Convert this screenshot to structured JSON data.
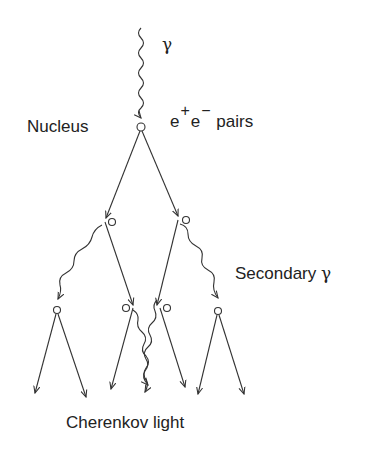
{
  "diagram": {
    "labels": {
      "incoming_gamma": "γ",
      "nucleus": "Nucleus",
      "pairs_e1": "e",
      "pairs_plus": "+",
      "pairs_e2": "e",
      "pairs_minus": "−",
      "pairs_word": "pairs",
      "secondary": "Secondary",
      "secondary_gamma": "γ",
      "cherenkov": "Cherenkov light"
    },
    "colors": {
      "line": "#333333",
      "text": "#222222",
      "background": "#ffffff"
    },
    "nodes": [
      {
        "id": "primary-interaction",
        "x": 141,
        "y": 127
      },
      {
        "id": "left-electron",
        "x": 112,
        "y": 222
      },
      {
        "id": "right-electron",
        "x": 186,
        "y": 220
      },
      {
        "id": "left-gamma-conversion",
        "x": 57,
        "y": 310
      },
      {
        "id": "left-mid",
        "x": 126,
        "y": 308
      },
      {
        "id": "right-mid",
        "x": 167,
        "y": 308
      },
      {
        "id": "right-gamma-conversion",
        "x": 218,
        "y": 311
      }
    ]
  }
}
